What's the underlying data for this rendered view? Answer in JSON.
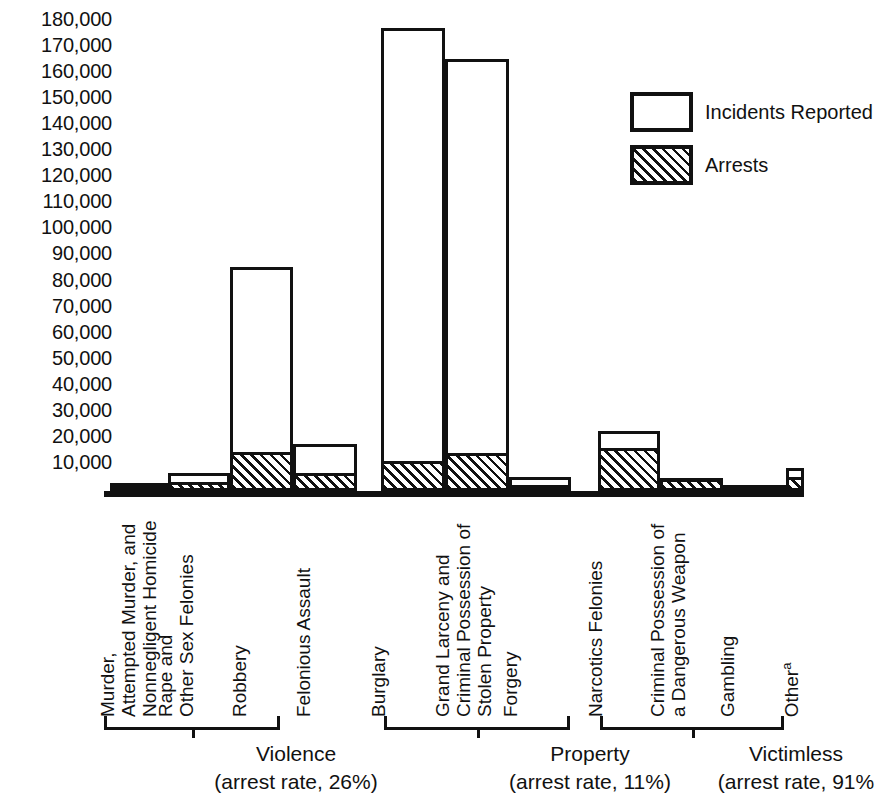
{
  "legend": {
    "items": [
      {
        "label": "Incidents Reported",
        "style": "outline",
        "swatch_name": "legend-swatch-incidents"
      },
      {
        "label": "Arrests",
        "style": "hatched",
        "swatch_name": "legend-swatch-arrests"
      }
    ]
  },
  "yaxis": {
    "ticks": [
      "180,000",
      "170,000",
      "160,000",
      "150,000",
      "140,000",
      "130,000",
      "120,000",
      "110,000",
      "100,000",
      "90,000",
      "80,000",
      "70,000",
      "60,000",
      "50,000",
      "40,000",
      "30,000",
      "20,000",
      "10,000"
    ]
  },
  "groups": [
    {
      "name": "Violence",
      "rate": "(arrest rate, 26%)"
    },
    {
      "name": "Property",
      "rate": "(arrest rate, 11%)"
    },
    {
      "name": "Victimless",
      "rate": "(arrest rate, 91%"
    }
  ],
  "categories": [
    {
      "label": "Murder, Attempted Murder, and Nonnegligent Homicide",
      "lines": [
        "Murder,",
        "Attempted Murder, and",
        "Nonnegligent Homicide"
      ]
    },
    {
      "label": "Rape and Other Sex Felonies",
      "lines": [
        "Rape and",
        "Other Sex Felonies"
      ]
    },
    {
      "label": "Robbery",
      "lines": [
        "Robbery"
      ]
    },
    {
      "label": "Felonious Assault",
      "lines": [
        "Felonious Assault"
      ]
    },
    {
      "label": "Burglary",
      "lines": [
        "Burglary"
      ]
    },
    {
      "label": "Grand Larceny and Criminal Possession of Stolen Property",
      "lines": [
        "Grand Larceny and",
        "Criminal Possession of",
        "Stolen Property"
      ]
    },
    {
      "label": "Forgery",
      "lines": [
        "Forgery"
      ]
    },
    {
      "label": "Narcotics Felonies",
      "lines": [
        "Narcotics Felonies"
      ]
    },
    {
      "label": "Criminal Possession of a Dangerous Weapon",
      "lines": [
        "Criminal Possession of",
        "a Dangerous Weapon"
      ]
    },
    {
      "label": "Gambling",
      "lines": [
        "Gambling"
      ]
    },
    {
      "label": "Other",
      "lines": [
        "Other"
      ],
      "superscript": "a"
    }
  ],
  "chart_data": {
    "type": "bar",
    "title": "",
    "xlabel": "",
    "ylabel": "",
    "ylim": [
      0,
      185000
    ],
    "ytick_step": 10000,
    "grid": false,
    "legend_position": "upper-right",
    "stacked_overlay": true,
    "categories": [
      "Murder, Attempted Murder, and Nonnegligent Homicide",
      "Rape and Other Sex Felonies",
      "Robbery",
      "Felonious Assault",
      "Burglary",
      "Grand Larceny and Criminal Possession of Stolen Property",
      "Forgery",
      "Narcotics Felonies",
      "Criminal Possession of a Dangerous Weapon",
      "Gambling",
      "Other"
    ],
    "groups": [
      "Violence",
      "Violence",
      "Violence",
      "Violence",
      "Property",
      "Property",
      "Property",
      "Victimless",
      "Victimless",
      "Victimless",
      "Victimless"
    ],
    "series": [
      {
        "name": "Incidents Reported",
        "values": [
          3000,
          7000,
          86000,
          18000,
          178000,
          166000,
          5500,
          23000,
          5000,
          2000,
          9000
        ]
      },
      {
        "name": "Arrests",
        "values": [
          1500,
          3500,
          15000,
          7000,
          11500,
          14500,
          2500,
          16500,
          4500,
          1800,
          5500
        ]
      }
    ],
    "group_arrest_rates": {
      "Violence": "26%",
      "Property": "11%",
      "Victimless": "91%"
    }
  },
  "geometry": {
    "baseline_value": 0,
    "px_per_unit": 0.0026,
    "plot_height_px": 491,
    "bars": [
      {
        "left": 6,
        "width": 58,
        "reported": 3000,
        "arrests": 1500
      },
      {
        "left": 64,
        "width": 62,
        "reported": 7000,
        "arrests": 3500
      },
      {
        "left": 126,
        "width": 63,
        "reported": 86000,
        "arrests": 15000
      },
      {
        "left": 189,
        "width": 64,
        "reported": 18000,
        "arrests": 7000
      },
      {
        "left": 277,
        "width": 64,
        "reported": 178000,
        "arrests": 11500
      },
      {
        "left": 341,
        "width": 64,
        "reported": 166000,
        "arrests": 14500
      },
      {
        "left": 405,
        "width": 62,
        "reported": 5500,
        "arrests": 2500
      },
      {
        "left": 494,
        "width": 62,
        "reported": 23000,
        "arrests": 16500
      },
      {
        "left": 556,
        "width": 63,
        "reported": 5000,
        "arrests": 4500
      },
      {
        "left": 619,
        "width": 63,
        "reported": 2000,
        "arrests": 1800
      },
      {
        "left": 682,
        "width": 18,
        "reported": 9000,
        "arrests": 5500
      }
    ],
    "cat_left": [
      14,
      72,
      146,
      210,
      285,
      349,
      417,
      502,
      564,
      634,
      698
    ],
    "brackets": [
      {
        "left": 0,
        "width": 176
      },
      {
        "left": 280,
        "width": 186
      },
      {
        "left": 496,
        "width": 184
      }
    ],
    "group_caption_center": [
      192,
      486,
      692
    ]
  }
}
